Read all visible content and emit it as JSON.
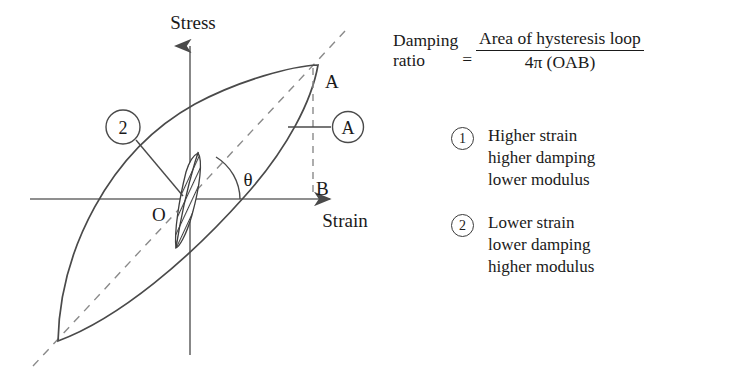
{
  "diagram": {
    "axes": {
      "y_axis_label": "Stress",
      "x_axis_label": "Strain"
    },
    "point_labels": {
      "origin": "O",
      "peak": "A",
      "base": "B",
      "angle": "θ"
    },
    "callouts": {
      "area_callout": "A",
      "loop_callout": "2"
    }
  },
  "equation": {
    "lhs_line1": "Damping",
    "lhs_line2": "ratio",
    "equals": "=",
    "numerator": "Area of hysteresis loop",
    "denominator": "4π (OAB)"
  },
  "legend": {
    "items": [
      {
        "number": "1",
        "line1": "Higher strain",
        "line2": "higher damping",
        "line3": "lower modulus"
      },
      {
        "number": "2",
        "line1": "Lower strain",
        "line2": "lower damping",
        "line3": "higher modulus"
      }
    ]
  },
  "colors": {
    "ink": "#1a1a1a",
    "line": "#4a4a4a",
    "background": "#ffffff"
  }
}
